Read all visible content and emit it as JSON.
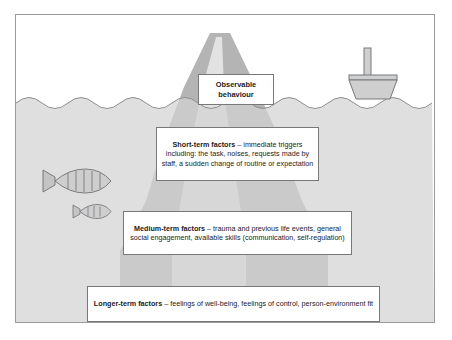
{
  "diagram": {
    "title_concept": "iceberg-model-of-behaviour",
    "colors": {
      "water": "#d3d3d3",
      "iceberg_dark": "#b4b4b4",
      "iceberg_light": "#e2e2e2",
      "boat": "#cfcfcf",
      "outline": "#77787a",
      "frame": "#9a9a9a",
      "text": "#1b1b1b",
      "background": "#ffffff"
    },
    "boxes": {
      "observable": {
        "label": "Observable behaviour",
        "line1": "Observable",
        "line2": "behaviour"
      },
      "short_term": {
        "heading": "Short-term factors",
        "dash": " – ",
        "body": "immediate triggers including: the task, noises, requests made by staff, a sudden change of routine or expectation"
      },
      "medium_term": {
        "heading": "Medium-term factors",
        "dash": " – ",
        "body": "trauma and previous life events, general social engagement, available skills (communication, self-regulation)"
      },
      "longer_term": {
        "heading": "Longer-term factors",
        "dash": " – ",
        "body": "feelings of well-being, feelings of control, person-environment fit"
      }
    },
    "scenery": {
      "boat": "boat-icon",
      "fish_large": "fish-icon",
      "fish_small": "fish-icon",
      "waterline": "wave-line",
      "iceberg": "iceberg-shape"
    }
  }
}
